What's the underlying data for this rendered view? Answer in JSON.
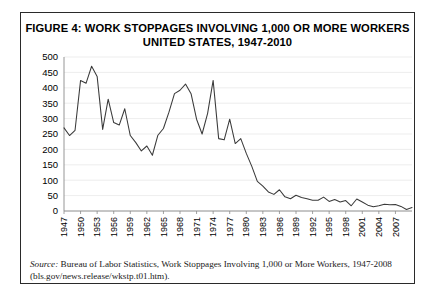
{
  "figure": {
    "title_line1": "FIGURE 4:  WORK STOPPAGES INVOLVING 1,000 OR MORE WORKERS",
    "title_line2": "UNITED STATES, 1947-2010",
    "source_label": "Source:",
    "source_text": " Bureau of Labor Statistics, Work Stoppages Involving 1,000 or More Workers, 1947-2008 (bls.gov/news.release/wkstp.t01.htm)."
  },
  "chart_data": {
    "type": "line",
    "title": "FIGURE 4:  WORK STOPPAGES INVOLVING 1,000 OR MORE WORKERS UNITED STATES, 1947-2010",
    "xlabel": "",
    "ylabel": "",
    "xlim": [
      1947,
      2010
    ],
    "ylim": [
      0,
      500
    ],
    "ytick_values": [
      0,
      50,
      100,
      150,
      200,
      250,
      300,
      350,
      400,
      450,
      500
    ],
    "ytick_labels": [
      "0",
      "50",
      "100",
      "150",
      "200",
      "250",
      "300",
      "350",
      "400",
      "450",
      "500"
    ],
    "xtick_values": [
      1947,
      1950,
      1953,
      1956,
      1959,
      1962,
      1965,
      1968,
      1971,
      1974,
      1977,
      1980,
      1983,
      1986,
      1989,
      1992,
      1995,
      1998,
      2001,
      2004,
      2007
    ],
    "xtick_labels": [
      "1947",
      "1950",
      "1953",
      "1956",
      "1959",
      "1962",
      "1965",
      "1968",
      "1971",
      "1974",
      "1977",
      "1980",
      "1983",
      "1986",
      "1989",
      "1992",
      "1995",
      "1998",
      "2001",
      "2004",
      "2007"
    ],
    "grid": true,
    "legend": "none",
    "line_color": "#3a3a3a",
    "x": [
      1947,
      1948,
      1949,
      1950,
      1951,
      1952,
      1953,
      1954,
      1955,
      1956,
      1957,
      1958,
      1959,
      1960,
      1961,
      1962,
      1963,
      1964,
      1965,
      1966,
      1967,
      1968,
      1969,
      1970,
      1971,
      1972,
      1973,
      1974,
      1975,
      1976,
      1977,
      1978,
      1979,
      1980,
      1981,
      1982,
      1983,
      1984,
      1985,
      1986,
      1987,
      1988,
      1989,
      1990,
      1991,
      1992,
      1993,
      1994,
      1995,
      1996,
      1997,
      1998,
      1999,
      2000,
      2001,
      2002,
      2003,
      2004,
      2005,
      2006,
      2007,
      2008,
      2009,
      2010
    ],
    "y": [
      270,
      245,
      262,
      424,
      415,
      470,
      437,
      265,
      363,
      287,
      279,
      332,
      245,
      222,
      195,
      211,
      181,
      246,
      268,
      321,
      381,
      392,
      412,
      381,
      298,
      250,
      317,
      424,
      235,
      231,
      298,
      219,
      235,
      187,
      145,
      96,
      81,
      62,
      54,
      69,
      46,
      40,
      51,
      44,
      40,
      35,
      35,
      45,
      31,
      37,
      29,
      34,
      17,
      39,
      29,
      19,
      14,
      17,
      22,
      20,
      21,
      15,
      5,
      11
    ]
  }
}
